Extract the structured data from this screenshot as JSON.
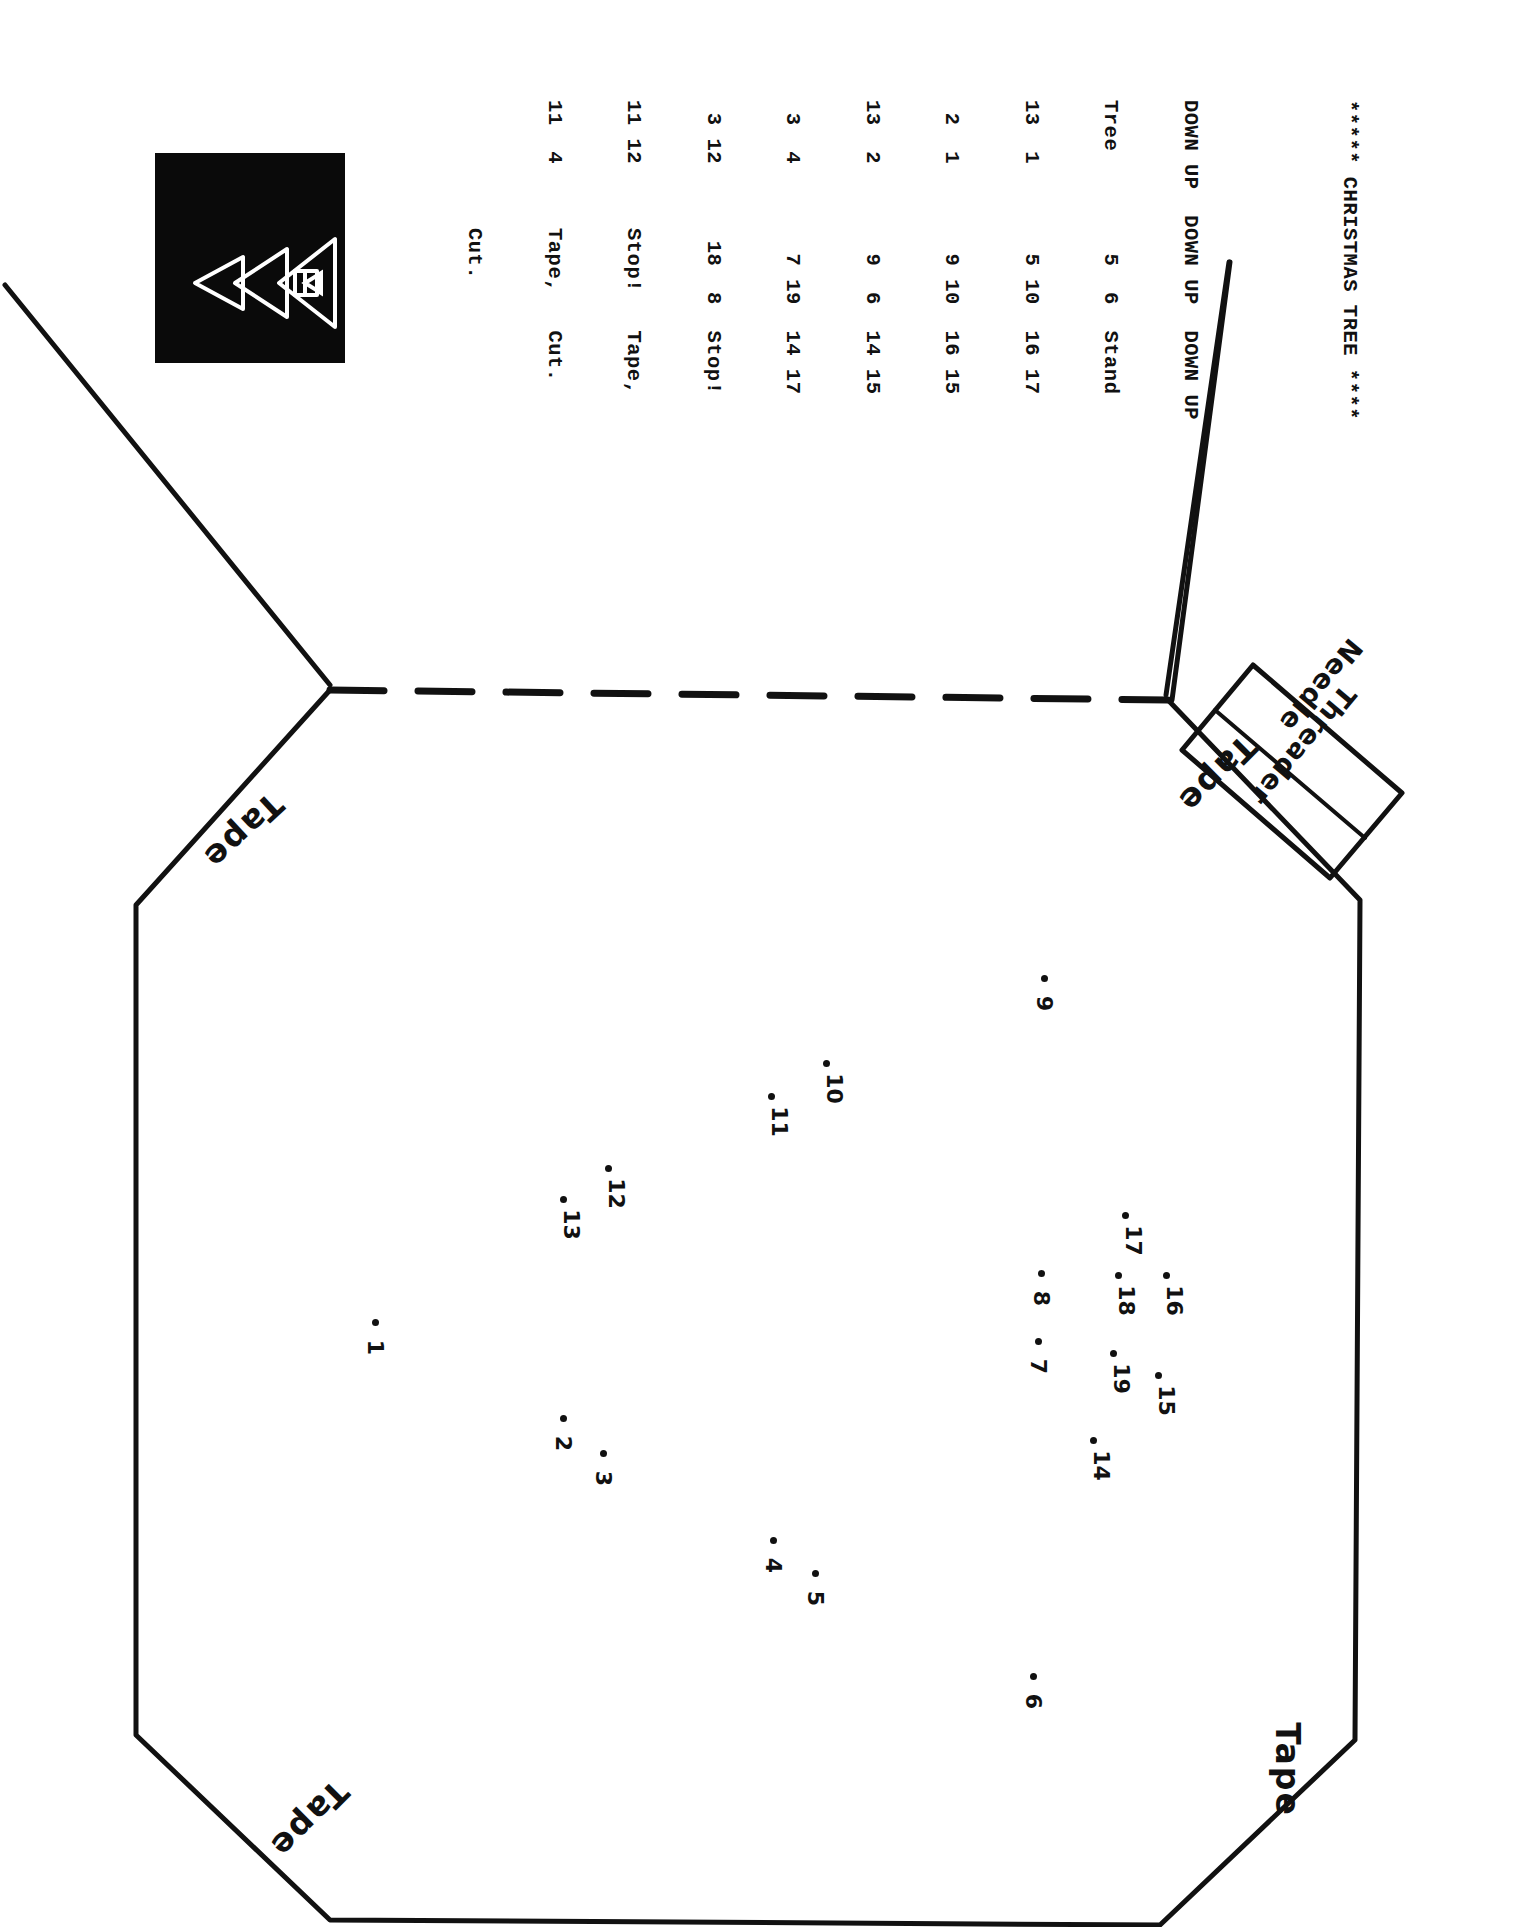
{
  "page": {
    "orientation": "rotated-90",
    "background": "#ffffff",
    "ink": "#111111"
  },
  "logo": {
    "name": "christmas-tree-icon",
    "background": "#0a0a0a",
    "stroke": "#ffffff"
  },
  "listing": {
    "title": "***** CHRISTMAS TREE ****",
    "blank": "",
    "header": "DOWN UP  DOWN UP  DOWN UP",
    "lines": [
      "Tree        5  6  Stand",
      "13  1       5 10  16 17",
      " 2  1       9 10  16 15",
      "13  2       9  6  14 15",
      " 3  4       7 19  14 17",
      " 3 12      18  8  Stop!",
      "11 12     Stop!   Tape,",
      "11  4     Tape,   Cut.",
      "          Cut."
    ],
    "columns": [
      {
        "label": "DOWN UP",
        "pairs": [
          [
            "Tree",
            ""
          ],
          [
            "13",
            "1"
          ],
          [
            "2",
            "1"
          ],
          [
            "13",
            "2"
          ],
          [
            "3",
            "4"
          ],
          [
            "3",
            "12"
          ],
          [
            "11",
            "12"
          ],
          [
            "11",
            "4"
          ]
        ]
      },
      {
        "label": "DOWN UP",
        "pairs": [
          [
            "5",
            "6"
          ],
          [
            "5",
            "10"
          ],
          [
            "9",
            "10"
          ],
          [
            "9",
            "6"
          ],
          [
            "7",
            "19"
          ],
          [
            "18",
            "8"
          ]
        ],
        "notes": [
          "Stop!",
          "Tape,",
          "Cut."
        ]
      },
      {
        "label": "DOWN UP",
        "pairs": [
          [
            "Stand",
            ""
          ],
          [
            "16",
            "17"
          ],
          [
            "16",
            "15"
          ],
          [
            "14",
            "15"
          ],
          [
            "14",
            "17"
          ]
        ],
        "notes": [
          "Stop!",
          "Tape,",
          "Cut."
        ]
      }
    ]
  },
  "labels": {
    "tape_top_left": "Tape",
    "tape_top_right": "Tape",
    "tape_bottom_left": "Tape",
    "tape_bottom_right": "Tape",
    "needle": "Needle",
    "threader": "Threader"
  },
  "dots": [
    {
      "n": "1",
      "x": 372,
      "y": 1319
    },
    {
      "n": "2",
      "x": 560,
      "y": 1415
    },
    {
      "n": "3",
      "x": 600,
      "y": 1450
    },
    {
      "n": "4",
      "x": 770,
      "y": 1537
    },
    {
      "n": "5",
      "x": 812,
      "y": 1570
    },
    {
      "n": "6",
      "x": 1030,
      "y": 1673
    },
    {
      "n": "7",
      "x": 1035,
      "y": 1338
    },
    {
      "n": "8",
      "x": 1038,
      "y": 1270
    },
    {
      "n": "9",
      "x": 1041,
      "y": 975
    },
    {
      "n": "10",
      "x": 823,
      "y": 1060
    },
    {
      "n": "11",
      "x": 768,
      "y": 1093
    },
    {
      "n": "12",
      "x": 605,
      "y": 1165
    },
    {
      "n": "13",
      "x": 560,
      "y": 1196
    },
    {
      "n": "14",
      "x": 1090,
      "y": 1437
    },
    {
      "n": "15",
      "x": 1155,
      "y": 1372
    },
    {
      "n": "16",
      "x": 1163,
      "y": 1272
    },
    {
      "n": "17",
      "x": 1122,
      "y": 1212
    },
    {
      "n": "18",
      "x": 1115,
      "y": 1272
    },
    {
      "n": "19",
      "x": 1110,
      "y": 1350
    }
  ]
}
